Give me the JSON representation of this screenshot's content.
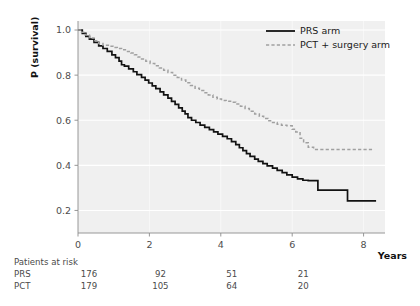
{
  "figure": {
    "panel_bg": "#f0f0f0",
    "grid_color": "#ffffff",
    "axis_color": "#8c8c8c",
    "prs_color": "#121212",
    "pct_color": "#a0a0a0"
  },
  "axes": {
    "ylabel": "P (survival)",
    "xlabel": "Years",
    "yticks": [
      "1.0",
      "0.8",
      "0.6",
      "0.4",
      "0.2"
    ],
    "ytick_values": [
      1.0,
      0.8,
      0.6,
      0.4,
      0.2
    ],
    "xticks": [
      "0",
      "2",
      "4",
      "6",
      "8"
    ],
    "xtick_values": [
      0,
      2,
      4,
      6,
      8
    ],
    "xlim": [
      0,
      8.6
    ],
    "ylim": [
      0.1,
      1.04
    ]
  },
  "legend": {
    "position": "top-right",
    "items": [
      {
        "label": "PRS arm",
        "style": "solid",
        "color": "#121212"
      },
      {
        "label": "PCT + surgery arm",
        "style": "dashed",
        "color": "#a0a0a0"
      }
    ]
  },
  "risk_table": {
    "title": "Patients at risk",
    "rows": [
      {
        "label": "PRS",
        "values": [
          "176",
          "92",
          "51",
          "21"
        ]
      },
      {
        "label": "PCT",
        "values": [
          "179",
          "105",
          "64",
          "20"
        ]
      }
    ],
    "time_points": [
      0,
      2,
      4,
      6
    ]
  },
  "chart_data": {
    "type": "line",
    "title": "",
    "xlabel": "Years",
    "ylabel": "P (survival)",
    "xlim": [
      0,
      8.6
    ],
    "ylim": [
      0.1,
      1.04
    ],
    "grid": true,
    "legend_position": "top-right",
    "curve_style": "step (Kaplan-Meier)",
    "series": [
      {
        "name": "PRS arm",
        "style": "solid",
        "color": "#121212",
        "points": [
          [
            0.0,
            1.0
          ],
          [
            0.12,
            0.985
          ],
          [
            0.22,
            0.972
          ],
          [
            0.32,
            0.96
          ],
          [
            0.45,
            0.945
          ],
          [
            0.58,
            0.93
          ],
          [
            0.7,
            0.918
          ],
          [
            0.82,
            0.905
          ],
          [
            0.95,
            0.89
          ],
          [
            1.05,
            0.878
          ],
          [
            1.15,
            0.862
          ],
          [
            1.22,
            0.846
          ],
          [
            1.3,
            0.84
          ],
          [
            1.42,
            0.828
          ],
          [
            1.55,
            0.815
          ],
          [
            1.65,
            0.802
          ],
          [
            1.78,
            0.79
          ],
          [
            1.88,
            0.778
          ],
          [
            1.98,
            0.765
          ],
          [
            2.08,
            0.752
          ],
          [
            2.18,
            0.74
          ],
          [
            2.3,
            0.726
          ],
          [
            2.4,
            0.712
          ],
          [
            2.52,
            0.698
          ],
          [
            2.62,
            0.684
          ],
          [
            2.72,
            0.67
          ],
          [
            2.82,
            0.655
          ],
          [
            2.92,
            0.64
          ],
          [
            3.0,
            0.628
          ],
          [
            3.08,
            0.612
          ],
          [
            3.18,
            0.6
          ],
          [
            3.3,
            0.59
          ],
          [
            3.42,
            0.578
          ],
          [
            3.55,
            0.568
          ],
          [
            3.68,
            0.558
          ],
          [
            3.8,
            0.548
          ],
          [
            3.92,
            0.538
          ],
          [
            4.05,
            0.528
          ],
          [
            4.18,
            0.518
          ],
          [
            4.3,
            0.505
          ],
          [
            4.42,
            0.492
          ],
          [
            4.52,
            0.478
          ],
          [
            4.62,
            0.465
          ],
          [
            4.72,
            0.452
          ],
          [
            4.82,
            0.44
          ],
          [
            4.95,
            0.428
          ],
          [
            5.05,
            0.418
          ],
          [
            5.18,
            0.408
          ],
          [
            5.3,
            0.398
          ],
          [
            5.45,
            0.388
          ],
          [
            5.58,
            0.378
          ],
          [
            5.72,
            0.368
          ],
          [
            5.85,
            0.358
          ],
          [
            6.0,
            0.348
          ],
          [
            6.15,
            0.34
          ],
          [
            6.3,
            0.334
          ],
          [
            6.45,
            0.332
          ],
          [
            6.62,
            0.332
          ],
          [
            6.72,
            0.29
          ],
          [
            6.9,
            0.29
          ],
          [
            7.4,
            0.29
          ],
          [
            7.55,
            0.242
          ],
          [
            8.0,
            0.242
          ],
          [
            8.35,
            0.242
          ]
        ]
      },
      {
        "name": "PCT + surgery arm",
        "style": "dashed",
        "color": "#a0a0a0",
        "points": [
          [
            0.0,
            1.0
          ],
          [
            0.1,
            0.99
          ],
          [
            0.2,
            0.978
          ],
          [
            0.32,
            0.965
          ],
          [
            0.45,
            0.952
          ],
          [
            0.58,
            0.94
          ],
          [
            0.7,
            0.932
          ],
          [
            0.85,
            0.928
          ],
          [
            0.98,
            0.922
          ],
          [
            1.1,
            0.918
          ],
          [
            1.22,
            0.912
          ],
          [
            1.35,
            0.905
          ],
          [
            1.48,
            0.898
          ],
          [
            1.58,
            0.89
          ],
          [
            1.68,
            0.88
          ],
          [
            1.78,
            0.872
          ],
          [
            1.9,
            0.862
          ],
          [
            2.02,
            0.852
          ],
          [
            2.15,
            0.842
          ],
          [
            2.28,
            0.832
          ],
          [
            2.4,
            0.822
          ],
          [
            2.52,
            0.812
          ],
          [
            2.65,
            0.8
          ],
          [
            2.78,
            0.79
          ],
          [
            2.9,
            0.778
          ],
          [
            3.02,
            0.766
          ],
          [
            3.15,
            0.754
          ],
          [
            3.28,
            0.742
          ],
          [
            3.4,
            0.732
          ],
          [
            3.52,
            0.722
          ],
          [
            3.65,
            0.712
          ],
          [
            3.78,
            0.702
          ],
          [
            3.9,
            0.694
          ],
          [
            4.02,
            0.688
          ],
          [
            4.15,
            0.684
          ],
          [
            4.3,
            0.68
          ],
          [
            4.42,
            0.672
          ],
          [
            4.55,
            0.662
          ],
          [
            4.68,
            0.652
          ],
          [
            4.8,
            0.64
          ],
          [
            4.95,
            0.628
          ],
          [
            5.08,
            0.618
          ],
          [
            5.2,
            0.608
          ],
          [
            5.32,
            0.598
          ],
          [
            5.45,
            0.59
          ],
          [
            5.58,
            0.582
          ],
          [
            5.7,
            0.578
          ],
          [
            5.85,
            0.575
          ],
          [
            6.0,
            0.56
          ],
          [
            6.1,
            0.548
          ],
          [
            6.22,
            0.52
          ],
          [
            6.32,
            0.5
          ],
          [
            6.45,
            0.48
          ],
          [
            6.6,
            0.47
          ],
          [
            6.8,
            0.47
          ],
          [
            7.2,
            0.47
          ],
          [
            7.6,
            0.47
          ],
          [
            8.0,
            0.47
          ],
          [
            8.3,
            0.47
          ]
        ]
      }
    ]
  }
}
